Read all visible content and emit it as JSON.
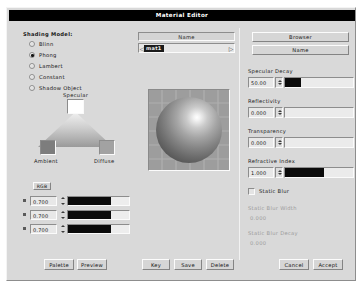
{
  "window": {
    "title": "Material Editor"
  },
  "shading": {
    "label": "Shading Model:",
    "options": [
      {
        "label": "Blinn",
        "selected": false
      },
      {
        "label": "Phong",
        "selected": true
      },
      {
        "label": "Lambert",
        "selected": false
      },
      {
        "label": "Constant",
        "selected": false
      },
      {
        "label": "Shadow Object",
        "selected": false
      }
    ]
  },
  "name_bar": {
    "header": "Name",
    "value": "mat1",
    "left_arrow": "◁",
    "right_arrow": "▷"
  },
  "browser": {
    "browser_label": "Browser",
    "name_label": "Name"
  },
  "color_triangle": {
    "specular_label": "Specular",
    "ambient_label": "Ambient",
    "diffuse_label": "Diffuse",
    "specular_color": "#ffffff",
    "ambient_color": "#7d7d7d",
    "diffuse_color": "#a2a2a2",
    "mode_button": "RGB"
  },
  "rgb_sliders": [
    {
      "channel": "R",
      "value": "0.700",
      "fill_pct": 70
    },
    {
      "channel": "G",
      "value": "0.700",
      "fill_pct": 70
    },
    {
      "channel": "B",
      "value": "0.700",
      "fill_pct": 70
    }
  ],
  "params": [
    {
      "label": "Specular Decay",
      "value": "50.00",
      "fill_pct": 23,
      "disabled": false
    },
    {
      "label": "Reflectivity",
      "value": "0.000",
      "fill_pct": 0,
      "disabled": false
    },
    {
      "label": "Transparency",
      "value": "0.000",
      "fill_pct": 0,
      "disabled": false
    },
    {
      "label": "Refractive Index",
      "value": "1.000",
      "fill_pct": 58,
      "disabled": false
    }
  ],
  "static_blur": {
    "checkbox_label": "Static Blur",
    "checked": false,
    "width_label": "Static Blur Width",
    "width_value": "0.000",
    "decay_label": "Static Blur Decay",
    "decay_value": "0.000"
  },
  "buttons": {
    "palette": "Palette",
    "preview": "Preview",
    "key": "Key",
    "save": "Save",
    "delete": "Delete",
    "cancel": "Cancel",
    "accept": "Accept"
  }
}
